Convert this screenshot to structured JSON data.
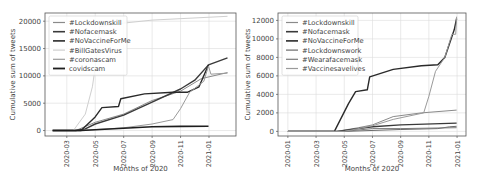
{
  "chart_data": [
    {
      "type": "line",
      "title": "",
      "xlabel": "Months of 2020",
      "ylabel": "Cumulative sum of tweets",
      "ylim": [
        -1000,
        21500
      ],
      "grid": true,
      "legend_position": "upper left",
      "x_ticks": [
        "2020-03",
        "2020-05",
        "2020-07",
        "2020-09",
        "2020-11",
        "2021-01"
      ],
      "y_ticks": [
        "0",
        "5000",
        "10000",
        "15000",
        "20000"
      ],
      "series": [
        {
          "name": "#Lockdownskill",
          "color": "#8a8a8a",
          "width": 1,
          "points": [
            [
              "2020-02-01",
              0
            ],
            [
              "2020-03-20",
              0
            ],
            [
              "2020-05-01",
              1500
            ],
            [
              "2020-07-01",
              3000
            ],
            [
              "2020-09-01",
              5500
            ],
            [
              "2020-11-01",
              7200
            ],
            [
              "2020-12-15",
              9500
            ],
            [
              "2021-02-10",
              10600
            ]
          ]
        },
        {
          "name": "#Nofacemask",
          "color": "#3a3a3a",
          "width": 1.4,
          "points": [
            [
              "2020-02-01",
              0
            ],
            [
              "2020-03-20",
              0
            ],
            [
              "2020-04-10",
              300
            ],
            [
              "2020-05-01",
              1200
            ],
            [
              "2020-07-01",
              2800
            ],
            [
              "2020-09-01",
              5200
            ],
            [
              "2020-11-01",
              7600
            ],
            [
              "2020-12-01",
              9200
            ],
            [
              "2020-12-30",
              12000
            ],
            [
              "2021-02-10",
              13300
            ]
          ]
        },
        {
          "name": "#NoVaccineForMe",
          "color": "#2a2a2a",
          "width": 1.4,
          "points": [
            [
              "2020-02-01",
              0
            ],
            [
              "2020-04-01",
              0
            ],
            [
              "2020-05-01",
              2500
            ],
            [
              "2020-05-15",
              4200
            ],
            [
              "2020-06-20",
              4400
            ],
            [
              "2020-06-25",
              5800
            ],
            [
              "2020-08-15",
              6700
            ],
            [
              "2020-10-15",
              7000
            ],
            [
              "2020-11-15",
              7000
            ],
            [
              "2020-12-10",
              8000
            ],
            [
              "2020-12-30",
              12000
            ]
          ]
        },
        {
          "name": "#BillGatesVirus",
          "color": "#cfcfcf",
          "width": 1,
          "points": [
            [
              "2020-02-01",
              0
            ],
            [
              "2020-03-15",
              0
            ],
            [
              "2020-04-10",
              3000
            ],
            [
              "2020-04-25",
              8000
            ],
            [
              "2020-05-05",
              14000
            ],
            [
              "2020-05-10",
              19000
            ],
            [
              "2020-06-15",
              19500
            ],
            [
              "2020-09-01",
              20200
            ],
            [
              "2021-02-10",
              20900
            ]
          ]
        },
        {
          "name": "#coronascam",
          "color": "#9a9a9a",
          "width": 1,
          "points": [
            [
              "2020-02-01",
              0
            ],
            [
              "2020-04-01",
              0
            ],
            [
              "2020-07-01",
              500
            ],
            [
              "2020-09-01",
              1200
            ],
            [
              "2020-10-15",
              2000
            ],
            [
              "2020-11-01",
              4000
            ],
            [
              "2020-11-20",
              7000
            ],
            [
              "2020-12-20",
              9000
            ],
            [
              "2020-12-30",
              11800
            ],
            [
              "2021-01-05",
              10300
            ],
            [
              "2021-02-10",
              10500
            ]
          ]
        },
        {
          "name": "covidscam",
          "color": "#1e1e1e",
          "width": 1.6,
          "points": [
            [
              "2020-02-01",
              0
            ],
            [
              "2020-04-01",
              0
            ],
            [
              "2020-07-01",
              400
            ],
            [
              "2020-09-01",
              700
            ],
            [
              "2020-11-01",
              750
            ],
            [
              "2020-12-30",
              800
            ]
          ]
        }
      ]
    },
    {
      "type": "line",
      "title": "",
      "xlabel": "Months of 2020",
      "ylabel": "Cumulative sum of tweets",
      "ylim": [
        -500,
        12800
      ],
      "grid": true,
      "legend_position": "upper left",
      "x_ticks": [
        "2020-01",
        "2020-03",
        "2020-05",
        "2020-07",
        "2020-09",
        "2020-11",
        "2021-01"
      ],
      "y_ticks": [
        "0",
        "2000",
        "4000",
        "6000",
        "8000",
        "10000",
        "12000"
      ],
      "series": [
        {
          "name": "#Lockdownskill",
          "color": "#8a8a8a",
          "width": 1,
          "points": [
            [
              "2020-01-01",
              0
            ],
            [
              "2020-04-15",
              0
            ],
            [
              "2020-06-01",
              400
            ],
            [
              "2020-07-01",
              700
            ],
            [
              "2020-08-15",
              1600
            ],
            [
              "2020-10-15",
              2000
            ],
            [
              "2020-12-30",
              2300
            ]
          ]
        },
        {
          "name": "#Nofacemask",
          "color": "#3a3a3a",
          "width": 1.4,
          "points": [
            [
              "2020-01-01",
              0
            ],
            [
              "2020-04-15",
              0
            ],
            [
              "2020-07-01",
              500
            ],
            [
              "2020-09-01",
              700
            ],
            [
              "2020-12-30",
              900
            ]
          ]
        },
        {
          "name": "#NoVaccineForMe",
          "color": "#2a2a2a",
          "width": 1.4,
          "points": [
            [
              "2020-01-01",
              0
            ],
            [
              "2020-04-10",
              0
            ],
            [
              "2020-05-10",
              3000
            ],
            [
              "2020-05-25",
              4300
            ],
            [
              "2020-06-20",
              4500
            ],
            [
              "2020-06-25",
              5900
            ],
            [
              "2020-08-15",
              6700
            ],
            [
              "2020-10-15",
              7100
            ],
            [
              "2020-11-20",
              7200
            ],
            [
              "2020-12-05",
              8000
            ],
            [
              "2020-12-25",
              11000
            ],
            [
              "2020-12-30",
              12200
            ]
          ]
        },
        {
          "name": "#Lockdownswork",
          "color": "#6a6a6a",
          "width": 1,
          "points": [
            [
              "2020-01-01",
              0
            ],
            [
              "2020-05-01",
              0
            ],
            [
              "2020-09-01",
              200
            ],
            [
              "2020-11-20",
              300
            ],
            [
              "2020-12-15",
              500
            ],
            [
              "2020-12-30",
              550
            ]
          ]
        },
        {
          "name": "#Wearafacemask",
          "color": "#7a7a7a",
          "width": 1,
          "points": [
            [
              "2020-01-01",
              0
            ],
            [
              "2020-05-01",
              0
            ],
            [
              "2020-07-01",
              300
            ],
            [
              "2020-09-01",
              300
            ],
            [
              "2020-12-30",
              400
            ]
          ]
        },
        {
          "name": "#Vaccinesavelives",
          "color": "#9a9a9a",
          "width": 1,
          "points": [
            [
              "2020-01-01",
              0
            ],
            [
              "2020-05-01",
              0
            ],
            [
              "2020-07-01",
              600
            ],
            [
              "2020-08-15",
              1300
            ],
            [
              "2020-10-20",
              2000
            ],
            [
              "2020-11-01",
              3800
            ],
            [
              "2020-11-15",
              6500
            ],
            [
              "2020-12-05",
              8000
            ],
            [
              "2020-12-20",
              10500
            ],
            [
              "2020-12-28",
              10500
            ],
            [
              "2020-12-30",
              12400
            ]
          ]
        }
      ]
    }
  ]
}
